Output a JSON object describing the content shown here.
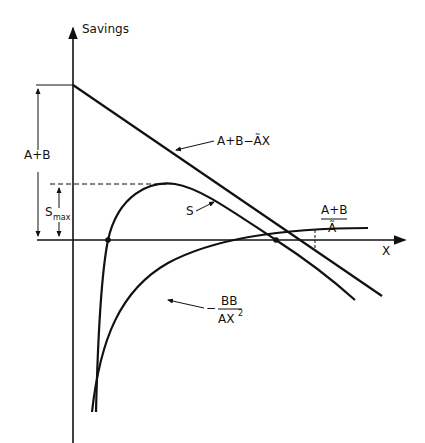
{
  "diagram": {
    "y_axis_label": "Savings",
    "x_axis_label": "X",
    "line_label": "A+B−ÃX",
    "curve_s_label": "S",
    "curve_neg_label_num": "BB",
    "curve_neg_label_den": "AX",
    "curve_neg_label_exp": "2",
    "curve_neg_sign": "−",
    "dim_intercept_label": "A+B",
    "dim_smax_label": "S",
    "dim_smax_sub": "max",
    "x_intercept_num": "A+B",
    "x_intercept_den": "Ã"
  },
  "colors": {
    "ink": "#111111",
    "background": "#ffffff"
  }
}
